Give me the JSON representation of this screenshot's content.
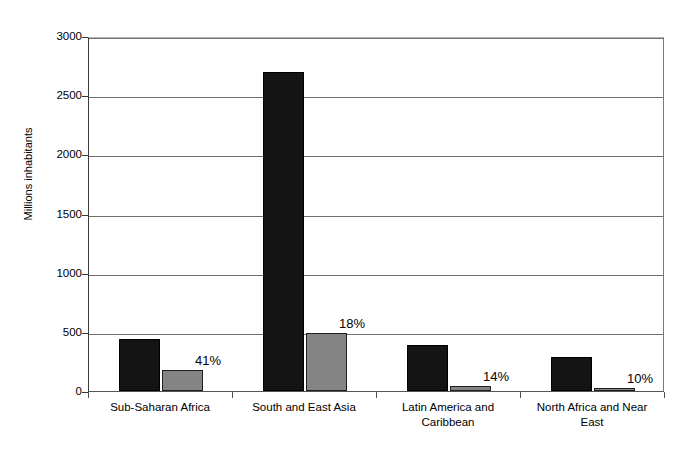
{
  "chart_data": {
    "type": "bar",
    "title": "",
    "xlabel": "",
    "ylabel": "Millions inhabitants",
    "ylim": [
      0,
      3000
    ],
    "yticks": [
      0,
      500,
      1000,
      1500,
      2000,
      2500,
      3000
    ],
    "ytick_labels": [
      "0",
      "500",
      "1000",
      "1500",
      "2000",
      "2500",
      "3000"
    ],
    "grid": true,
    "legend": "none",
    "categories": [
      "Sub-Saharan Africa",
      "South and East Asia",
      "Latin America and Caribbean",
      "North Africa and Near East"
    ],
    "category_lines": [
      [
        "Sub-Saharan Africa"
      ],
      [
        "South and East Asia"
      ],
      [
        "Latin America and",
        "Caribbean"
      ],
      [
        "North Africa and Near",
        "East"
      ]
    ],
    "series": [
      {
        "name": "total-population",
        "color": "#141414",
        "values": [
          440,
          2700,
          390,
          290
        ]
      },
      {
        "name": "undernourished-population",
        "color": "#848484",
        "values": [
          180,
          490,
          45,
          20
        ]
      }
    ],
    "annotations": [
      "41%",
      "18%",
      "14%",
      "10%"
    ]
  },
  "colors": {
    "dark_bar": "#141414",
    "light_bar": "#848484",
    "gridline": "#6f6f6f",
    "axis": "#3a3a3a",
    "background": "#ffffff",
    "text": "#000000"
  }
}
